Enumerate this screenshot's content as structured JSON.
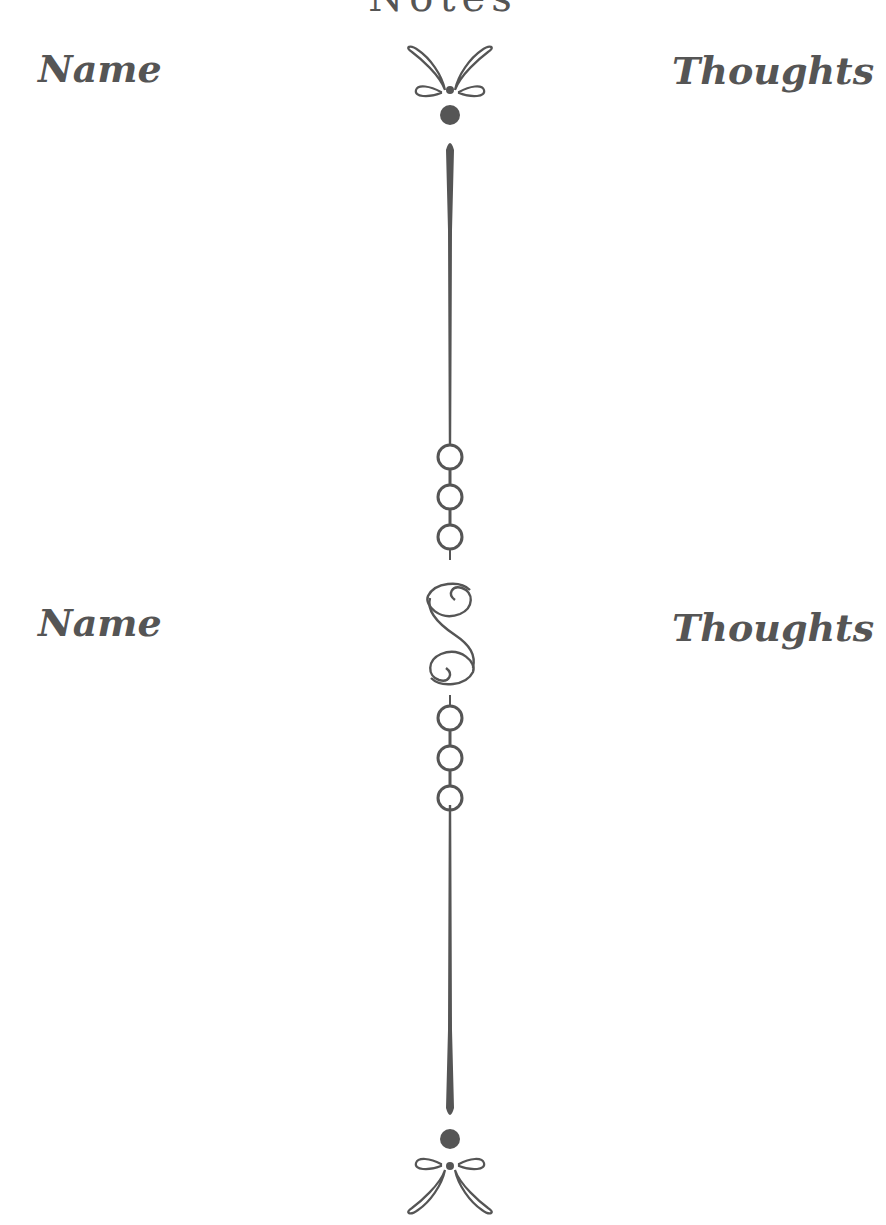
{
  "page": {
    "title": "Notes",
    "sections": [
      {
        "left_label": "Name",
        "right_label": "Thoughts"
      },
      {
        "left_label": "Name",
        "right_label": "Thoughts"
      }
    ]
  },
  "colors": {
    "ink": "#555555",
    "background": "#ffffff"
  },
  "decorations": {
    "top": "flourish-ornament",
    "divider": "vertical-line-with-beads",
    "middle": "s-scroll-ornament",
    "bottom": "flourish-ornament"
  }
}
